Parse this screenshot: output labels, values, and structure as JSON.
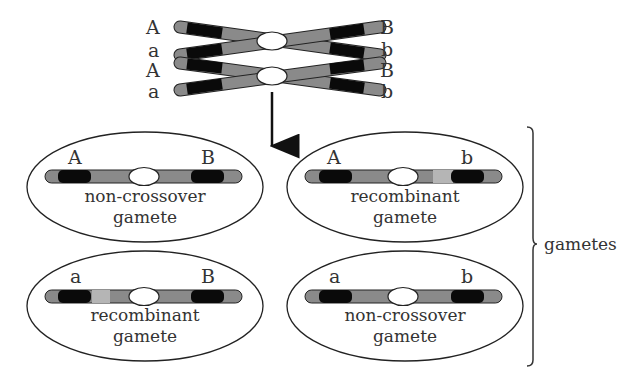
{
  "parent": {
    "left_alleles": [
      "A",
      "a",
      "A",
      "a"
    ],
    "right_alleles": [
      "B",
      "b",
      "B",
      "b"
    ]
  },
  "gametes": [
    {
      "left": "A",
      "right": "B",
      "caption_line1": "non-crossover",
      "caption_line2": "gamete",
      "type": "non-crossover"
    },
    {
      "left": "A",
      "right": "b",
      "caption_line1": "recombinant",
      "caption_line2": "gamete",
      "type": "recombinant"
    },
    {
      "left": "a",
      "right": "B",
      "caption_line1": "recombinant",
      "caption_line2": "gamete",
      "type": "recombinant"
    },
    {
      "left": "a",
      "right": "b",
      "caption_line1": "non-crossover",
      "caption_line2": "gamete",
      "type": "non-crossover"
    }
  ],
  "bracket_label": "gametes",
  "colors": {
    "chromatid": "#8a8a8a",
    "gene_band": "#0a0a0a",
    "outline": "#222222",
    "centromere": "#ffffff",
    "light_segment": "#b5b5b5"
  }
}
